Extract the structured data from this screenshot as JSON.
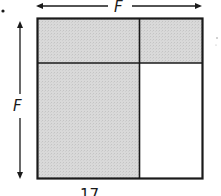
{
  "diagram": {
    "top_dimension_label": "F",
    "left_dimension_label": "F",
    "bottom_label": "17",
    "colors": {
      "shaded": "#d6d6d6",
      "unshaded": "#ffffff",
      "stroke": "#1a1a1a"
    },
    "regions": [
      {
        "id": "top-left",
        "shaded": true
      },
      {
        "id": "top-right",
        "shaded": true
      },
      {
        "id": "bottom-left",
        "shaded": true
      },
      {
        "id": "bottom-right",
        "shaded": false
      }
    ]
  }
}
